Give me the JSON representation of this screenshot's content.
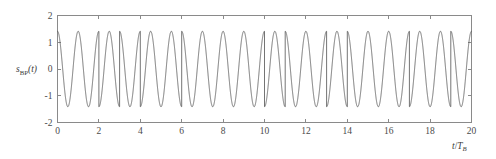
{
  "figure": {
    "kind": "line-plot",
    "background_color": "#ffffff",
    "axis_color": "#8a8a8a",
    "curve_color": "#5b5b5b"
  },
  "ylabel": {
    "base": "s",
    "subscript": "BP",
    "arg": "(t)",
    "full": "s_BP(t)"
  },
  "xlabel": {
    "numerator": "t",
    "separator": "/",
    "denominator": "T",
    "subscript": "B",
    "full": "t/T_B"
  },
  "chart_data": {
    "type": "line",
    "title": "",
    "subtitle": "",
    "xlabel": "t/T_B",
    "ylabel": "s_BP(t)",
    "xlim": [
      0,
      20
    ],
    "ylim": [
      -2,
      2
    ],
    "xticks": [
      0,
      2,
      4,
      6,
      8,
      10,
      12,
      14,
      16,
      18,
      20
    ],
    "xtick_labels": [
      "0",
      "2",
      "4",
      "6",
      "8",
      "10",
      "12",
      "14",
      "16",
      "18",
      "20"
    ],
    "yticks": [
      -2,
      -1,
      0,
      1,
      2
    ],
    "ytick_labels": [
      "-2",
      "-1",
      "0",
      "1",
      "2"
    ],
    "grid": false,
    "legend": null,
    "series": [
      {
        "name": "s_BP(t)",
        "color": "#5b5b5b",
        "description": "BPSK bandpass waveform: amplitude 1.41 cosine carrier at 1 cycle per bit interval, phase flipped by pi on bits equal to 0",
        "amplitude": 1.41,
        "carrier_cycles_per_bit": 1,
        "samples_per_bit": 400,
        "bit_duration": 1,
        "bits": [
          1,
          1,
          0,
          1,
          0,
          0,
          1,
          1,
          1,
          1,
          0,
          1,
          1,
          0,
          1,
          1,
          1,
          0,
          0,
          1
        ],
        "phase_reversal_times": [
          2,
          3,
          4,
          6,
          10,
          11,
          13,
          14,
          17,
          19
        ],
        "peak_value": 1.41,
        "trough_value": -1.41,
        "value_at_t0": 1.41
      }
    ]
  }
}
